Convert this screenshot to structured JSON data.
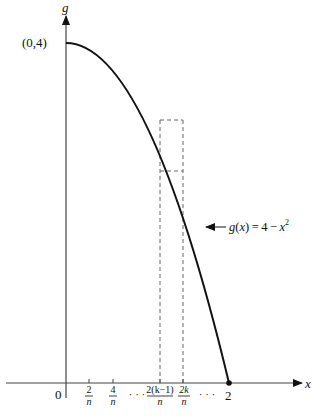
{
  "figure": {
    "axes": {
      "x_label": "x",
      "y_label": "g"
    },
    "function_label": {
      "g": "g",
      "lpar": "(",
      "x": "x",
      "rpar_eq": ") = 4 − ",
      "xsq": "x",
      "exp": "2"
    },
    "points": {
      "intercept_y": "(0,4)",
      "origin": "0",
      "intercept_x": "2"
    },
    "ticks": [
      {
        "num": "2",
        "den": "n"
      },
      {
        "num": "4",
        "den": "n"
      },
      {
        "num": "2(k−1)",
        "den": "n"
      },
      {
        "num": "2k",
        "den": "n"
      }
    ],
    "ellipsis": "· · ·",
    "colors": {
      "curve": "#111111",
      "axis": "#444444",
      "dashed": "#666666"
    }
  }
}
